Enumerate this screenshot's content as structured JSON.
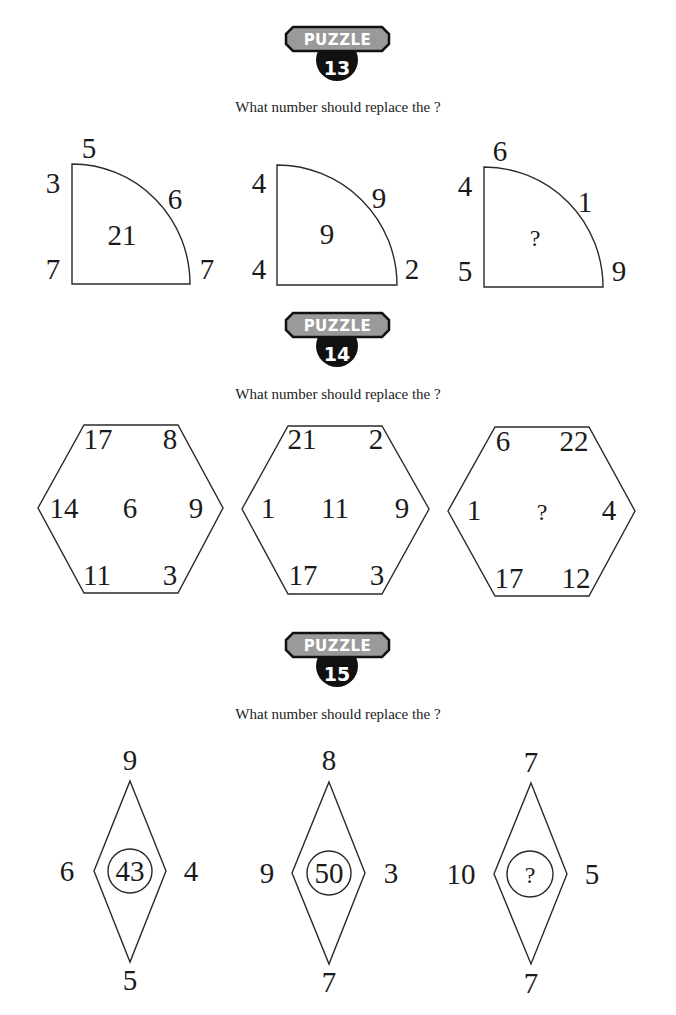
{
  "prompt": "What number should replace the ?",
  "colors": {
    "badge_gray": "#9a9a9a",
    "badge_dark": "#111111",
    "ink": "#1a1a1a"
  },
  "puzzles": [
    {
      "badge": {
        "label": "PUZZLE",
        "number": "13"
      },
      "prompt": "What number should replace the ?",
      "shape": "quarter-circle",
      "figures": [
        {
          "top": "5",
          "left_top": "3",
          "left_bottom": "7",
          "arc": "6",
          "right_bottom": "7",
          "center": "21"
        },
        {
          "top": "4",
          "left_top": "4",
          "left_bottom": "4",
          "arc": "9",
          "right_bottom": "2",
          "center": "9"
        },
        {
          "top": "6",
          "left_top": "4",
          "left_bottom": "5",
          "arc": "1",
          "right_bottom": "9",
          "center": "?"
        }
      ]
    },
    {
      "badge": {
        "label": "PUZZLE",
        "number": "14"
      },
      "prompt": "What number should replace the ?",
      "shape": "hexagon",
      "figures": [
        {
          "top_left": "17",
          "top_right": "8",
          "left": "14",
          "center": "6",
          "right": "9",
          "bottom_left": "11",
          "bottom_right": "3"
        },
        {
          "top_left": "21",
          "top_right": "2",
          "left": "1",
          "center": "11",
          "right": "9",
          "bottom_left": "17",
          "bottom_right": "3"
        },
        {
          "top_left": "6",
          "top_right": "22",
          "left": "1",
          "center": "?",
          "right": "4",
          "bottom_left": "17",
          "bottom_right": "12"
        }
      ]
    },
    {
      "badge": {
        "label": "PUZZLE",
        "number": "15"
      },
      "prompt": "What number should replace the ?",
      "shape": "diamond-with-circle",
      "figures": [
        {
          "top": "9",
          "left": "6",
          "center": "43",
          "right": "4",
          "bottom": "5"
        },
        {
          "top": "8",
          "left": "9",
          "center": "50",
          "right": "3",
          "bottom": "7"
        },
        {
          "top": "7",
          "left": "10",
          "center": "?",
          "right": "5",
          "bottom": "7"
        }
      ]
    }
  ]
}
